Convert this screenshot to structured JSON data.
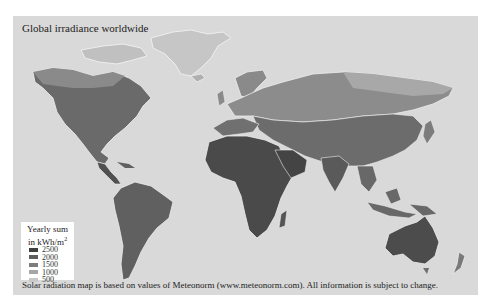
{
  "map": {
    "title": "Global irradiance worldwide",
    "background_color": "#d9d9d9",
    "ocean_color": "#d9d9d9"
  },
  "legend": {
    "title_line1": "Yearly sum",
    "title_line2": "in kWh/m",
    "title_sup": "2",
    "items": [
      {
        "label": "2500",
        "color": "#3f3f3f"
      },
      {
        "label": "2000",
        "color": "#5e5e5e"
      },
      {
        "label": "1500",
        "color": "#7c7c7c"
      },
      {
        "label": "1000",
        "color": "#a6a6a6"
      },
      {
        "label": "500",
        "color": "#c8c8c8"
      }
    ]
  },
  "footer": {
    "text": "Solar radiation map is based on values of Meteonorm (www.meteonorm.com). All information is subject to change."
  }
}
